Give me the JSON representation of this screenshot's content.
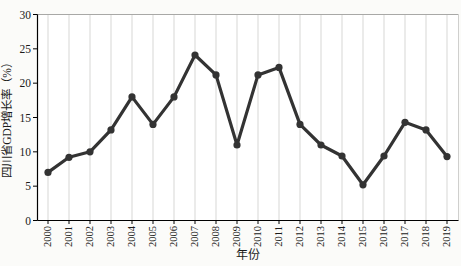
{
  "chart_data": {
    "type": "line",
    "title": "",
    "xlabel": "年份",
    "ylabel": "四川省GDP增长率（%）",
    "categories": [
      "2000",
      "2001",
      "2002",
      "2003",
      "2004",
      "2005",
      "2006",
      "2007",
      "2008",
      "2009",
      "2010",
      "2011",
      "2012",
      "2013",
      "2014",
      "2015",
      "2016",
      "2017",
      "2018",
      "2019"
    ],
    "series": [
      {
        "name": "四川省GDP增长率",
        "values": [
          7.0,
          9.2,
          10.0,
          13.2,
          18.0,
          14.0,
          18.0,
          24.1,
          21.2,
          11.0,
          21.2,
          22.3,
          14.0,
          11.0,
          9.4,
          5.2,
          9.4,
          14.3,
          13.2,
          9.3
        ]
      }
    ],
    "ylim": [
      0,
      30
    ],
    "yticks": [
      0,
      5,
      10,
      15,
      20,
      25,
      30
    ],
    "grid": "vertical",
    "legend": "none",
    "colors": {
      "line": "#333333",
      "marker": "#333333",
      "gridline": "#d7d7d5",
      "axis": "#000000",
      "frame_top": "#a8a8a6",
      "frame_right": "#cfcfcd",
      "background": "#fbfbf9",
      "text": "#1a1a1a"
    }
  }
}
